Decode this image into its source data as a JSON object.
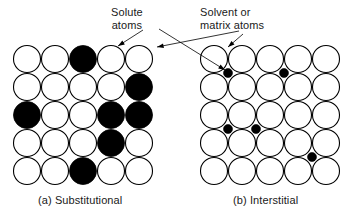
{
  "figure": {
    "width": 353,
    "height": 217,
    "background": "#ffffff",
    "ink_color": "#000000"
  },
  "annotations": {
    "solute": {
      "line1": "Solute",
      "line2": "atoms"
    },
    "solvent": {
      "line1": "Solvent or",
      "line2": "matrix atoms"
    }
  },
  "panels": {
    "a": {
      "caption": "(a) Substitutional",
      "origin_x": 13,
      "origin_y": 45,
      "rows": 5,
      "cols": 5,
      "pitch": 28,
      "radius": 14,
      "host_fill": "#ffffff",
      "solute_fill": "#000000",
      "solute_cells": [
        {
          "row": 0,
          "col": 2
        },
        {
          "row": 1,
          "col": 4
        },
        {
          "row": 2,
          "col": 0
        },
        {
          "row": 2,
          "col": 3
        },
        {
          "row": 2,
          "col": 4
        },
        {
          "row": 3,
          "col": 3
        },
        {
          "row": 4,
          "col": 2
        }
      ]
    },
    "b": {
      "caption": "(b) Interstitial",
      "origin_x": 200,
      "origin_y": 45,
      "rows": 5,
      "cols": 5,
      "pitch": 28,
      "radius": 14,
      "host_fill": "#ffffff",
      "interstitial_fill": "#000000",
      "interstitial_radius": 4.5,
      "interstitial_sites": [
        {
          "x": 228,
          "y": 73
        },
        {
          "x": 284,
          "y": 73
        },
        {
          "x": 228,
          "y": 129
        },
        {
          "x": 256,
          "y": 129
        },
        {
          "x": 312,
          "y": 157
        }
      ]
    }
  },
  "leaders": [
    {
      "name": "solute-to-dark-atom",
      "x1": 143,
      "y1": 30,
      "x2": 118,
      "y2": 46
    },
    {
      "name": "solvent-to-left-host-atom",
      "x1": 239,
      "y1": 31,
      "x2": 157,
      "y2": 47
    },
    {
      "name": "solvent-to-interstitial-dot",
      "x1": 159,
      "y1": 29,
      "x2": 225,
      "y2": 70
    },
    {
      "name": "solvent-to-right-host-atom",
      "x1": 243,
      "y1": 34,
      "x2": 228,
      "y2": 47
    }
  ]
}
